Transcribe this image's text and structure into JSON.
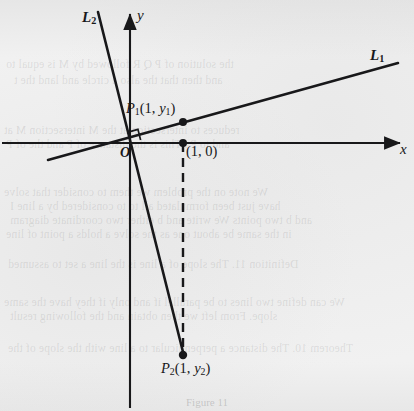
{
  "figure": {
    "caption": "Figure 11",
    "background_color": "#efefef",
    "ink_color": "#18181a"
  },
  "axes": {
    "y_label": "y",
    "x_label": "x",
    "origin_label": "O",
    "x_axis": {
      "y": 143,
      "x_start": 2,
      "x_end": 400
    },
    "y_axis": {
      "x": 130,
      "y_start": 12,
      "y_end": 408
    }
  },
  "lines": [
    {
      "name": "L1",
      "label": "L",
      "label_sub": "1",
      "label_x": 370,
      "label_y": 48,
      "x1": 48,
      "y1": 160,
      "x2": 398,
      "y2": 63,
      "description": "line with small positive slope through origin"
    },
    {
      "name": "L2",
      "label": "L",
      "label_sub": "2",
      "label_x": 82,
      "label_y": 10,
      "x1": 98,
      "y1": 12,
      "x2": 184,
      "y2": 356,
      "description": "line with steep negative slope through origin, perpendicular to L1"
    }
  ],
  "points": [
    {
      "name": "P1",
      "label": "P",
      "label_sub": "1",
      "label_args": "(1, y",
      "label_argsub": "1",
      "label_close": ")",
      "x": 183,
      "y": 122,
      "on_line": "L1"
    },
    {
      "name": "point-1-0",
      "label": "(1, 0)",
      "x": 183,
      "y": 143,
      "on_line": "x-axis"
    },
    {
      "name": "P2",
      "label": "P",
      "label_sub": "2",
      "label_args": "(1, y",
      "label_argsub": "2",
      "label_close": ")",
      "x": 183,
      "y": 355,
      "on_line": "L2"
    }
  ],
  "dashed_segment": {
    "x": 183,
    "y_top": 143,
    "y_bottom": 352
  },
  "right_angle_mark": {
    "x": 130,
    "y": 143,
    "size": 11,
    "at": "origin"
  },
  "ghost_text": [
    {
      "text": "the solution of P Q  R  followed  by   M   is equal to",
      "x": 6,
      "y": 58,
      "size": 11.5
    },
    {
      "text": "and then  that  the  also  a  circle   and  land  the  t",
      "x": 14,
      "y": 74,
      "size": 11.5
    },
    {
      "text": "reduces  to  intersection  at  the  M  intersection  M  at",
      "x": 4,
      "y": 124,
      "size": 11.5
    },
    {
      "text": "and  to  P  . This  is  the  distance  of  P  and  the  of  P",
      "x": 6,
      "y": 138,
      "size": 11.5
    },
    {
      "text": "We  note  on  the  problem  we  them  to  consider  that  solve",
      "x": 4,
      "y": 186,
      "size": 11.5
    },
    {
      "text": "have  just  been  formulated  all  to  to  considered  by  a  line  I",
      "x": 10,
      "y": 200,
      "size": 11.5
    },
    {
      "text": "and  b   two  points  We  write  and  b  either  two  coordinate  diagram",
      "x": 10,
      "y": 214,
      "size": 11.5
    },
    {
      "text": "in   the  same  be  about  one  as  the  solve  a  holds  a  point  of  line",
      "x": 6,
      "y": 228,
      "size": 11.5
    },
    {
      "text": "Definition  11.  The  slope  of  a  line  is  the  line  a  set  to  assumed",
      "x": 8,
      "y": 258,
      "size": 11.5
    },
    {
      "text": "We  can  define  two  lines  to  be  parallel  if  and  only  if  they  have  the  same",
      "x": 4,
      "y": 296,
      "size": 11.5
    },
    {
      "text": "slope.  From  left  we  then  obtain  and  the  following  result",
      "x": 10,
      "y": 310,
      "size": 11.5
    },
    {
      "text": "Theorem  10.  The  distance  a  perpendicular  to  a  line  with  the  slope  of  the",
      "x": 8,
      "y": 342,
      "size": 11.5
    }
  ]
}
